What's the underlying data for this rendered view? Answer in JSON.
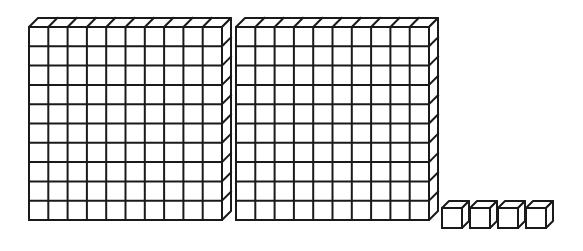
{
  "diagram": {
    "type": "base-ten-blocks",
    "stroke_color": "#1a1a1a",
    "fill_color": "#ffffff",
    "flats": [
      {
        "label": "hundred-flat-1",
        "x": 29,
        "y": 27,
        "rows": 10,
        "cols": 10,
        "cell": 19.3,
        "depth_dx": 9,
        "depth_dy": 9
      },
      {
        "label": "hundred-flat-2",
        "x": 236,
        "y": 27,
        "rows": 10,
        "cols": 10,
        "cell": 19.3,
        "depth_dx": 9,
        "depth_dy": 9
      }
    ],
    "units": [
      {
        "label": "unit-cube-1",
        "x": 442,
        "y": 208,
        "size": 20,
        "depth": 7
      },
      {
        "label": "unit-cube-2",
        "x": 470,
        "y": 208,
        "size": 20,
        "depth": 7
      },
      {
        "label": "unit-cube-3",
        "x": 498,
        "y": 208,
        "size": 20,
        "depth": 7
      },
      {
        "label": "unit-cube-4",
        "x": 526,
        "y": 208,
        "size": 20,
        "depth": 7
      }
    ],
    "represented_value": 204
  }
}
